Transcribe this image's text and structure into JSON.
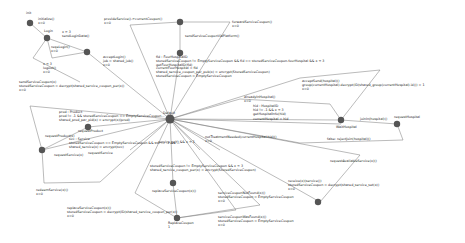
{
  "diagram": {
    "type": "state-machine",
    "nodes": [
      {
        "id": "init",
        "label": "init",
        "x": 30,
        "y": 23
      },
      {
        "id": "login",
        "label": "Login",
        "x": 47,
        "y": 38
      },
      {
        "id": "s2",
        "label": "",
        "x": 87,
        "y": 52
      },
      {
        "id": "s_top",
        "label": "",
        "x": 180,
        "y": 22
      },
      {
        "id": "s_topmid",
        "label": "",
        "x": 180,
        "y": 53
      },
      {
        "id": "central",
        "label": "Default",
        "x": 170,
        "y": 119
      },
      {
        "id": "reqProduct",
        "label": "requestProduct",
        "x": 88,
        "y": 127
      },
      {
        "id": "reqService",
        "label": "requestService",
        "x": 42,
        "y": 150
      },
      {
        "id": "waitHospital",
        "label": "WaitHospital",
        "x": 341,
        "y": 120
      },
      {
        "id": "reqHospital",
        "label": "requestHospital",
        "x": 397,
        "y": 124
      },
      {
        "id": "s_repl1",
        "label": "",
        "x": 173,
        "y": 183
      },
      {
        "id": "replaceCoupon",
        "label": "ReplaceCoupon",
        "x": 177,
        "y": 218
      },
      {
        "id": "s_right",
        "label": "",
        "x": 318,
        "y": 202
      }
    ],
    "labels": [
      {
        "id": "l_init",
        "text": "initialize()\nx=0",
        "x": 38,
        "y": 18
      },
      {
        "id": "l_login_s2",
        "text": "x > 3\nsendLoginData()",
        "x": 62,
        "y": 31
      },
      {
        "id": "l_reqlogin",
        "text": "reqeLogin()\nx=0",
        "x": 51,
        "y": 46
      },
      {
        "id": "l_x3",
        "text": "x < 3\nlogout()\nx=0",
        "x": 43,
        "y": 63
      },
      {
        "id": "l_accept",
        "text": "acceptLogin()\njob = shared_job()\nx=0",
        "x": 103,
        "y": 56
      },
      {
        "id": "l_provide",
        "text": "provideService()->currentCoupon()\nx=0",
        "x": 104,
        "y": 18
      },
      {
        "id": "l_forward",
        "text": "forwardServiceCoupon()\nx=0",
        "x": 232,
        "y": 21
      },
      {
        "id": "l_sendcoupon",
        "text": "sendServiceCouponViaPlatform()",
        "x": 185,
        "y": 35
      },
      {
        "id": "l_fid",
        "text": "fid : FourHospitalID\nstoredServiceCoupon != EmptyServiceCoupon && fid == storedServiceCoupon.fourHospital && x < 3\ngetFourHospitalID(fid)\ncurrentFourHospital = fid\nshared_service_coupon_per_pub(x) = encrypt(StoredServiceCoupon)\nstoredServiceCoupon = EmptyServiceCoupon",
        "x": 156,
        "y": 56
      },
      {
        "id": "l_sendsvc",
        "text": "sendServiceCoupon(x)\nstoredServiceCoupon = decrypt(shared_service_coupon_per(x))\nx=0",
        "x": 19,
        "y": 81
      },
      {
        "id": "l_prod",
        "text": "prod : Product\nprod != -1 && storedServiceCoupon == EmptyServiceCoupon...\nshared_prod_par_pid(x) = encrypt(x)(prod)",
        "x": 59,
        "y": 111
      },
      {
        "id": "l_reqprod",
        "text": "requestProduct(x)",
        "x": 45,
        "y": 135
      },
      {
        "id": "l_svc",
        "text": "svc : Service\nstoredServiceCoupon == EmptyServiceCoupon && svc != -1 && ...\nshared_service(x) = encrypt(svc)",
        "x": 69,
        "y": 138
      },
      {
        "id": "l_reqsvc",
        "text": "requestService(x)",
        "x": 54,
        "y": 154
      },
      {
        "id": "l_redeem",
        "text": "redeemService(x)()\nx=0",
        "x": 36,
        "y": 189
      },
      {
        "id": "l_already",
        "text": "alreadyInHospital()\nx=0",
        "x": 244,
        "y": 96
      },
      {
        "id": "l_hosp",
        "text": "hid : HospitalID\nhid != -1 && x < 3\ngetHospitalInfo(hid)",
        "x": 253,
        "y": 105
      },
      {
        "id": "l_curhosp",
        "text": "currentHospital = hid",
        "x": 253,
        "y": 118
      },
      {
        "id": "l_notin",
        "text": "notTreatmentNeeded(currentHospital.hid)()\nx=0",
        "x": 205,
        "y": 136
      },
      {
        "id": "l_service_ret",
        "text": "...service_self) && x < 1",
        "x": 155,
        "y": 141
      },
      {
        "id": "l_acceptB",
        "text": "acceptSend(hospital)()\ngroup(currentHospital).decrypt(ID(shared_group(currentHospital).id))) = 1\nx=0",
        "x": 302,
        "y": 80
      },
      {
        "id": "l_joinin",
        "text": "joinIn(hospital)()",
        "x": 360,
        "y": 118
      },
      {
        "id": "l_reqhosp",
        "text": "requestHospital",
        "x": 396,
        "y": 118
      },
      {
        "id": "l_false",
        "text": "false: rejectJoin(hospital)()",
        "x": 327,
        "y": 138
      },
      {
        "id": "l_avail",
        "text": "requestAvailableService(x)()",
        "x": 330,
        "y": 160
      },
      {
        "id": "l_stored2",
        "text": "storedServiceCoupon != EmptyServiceCoupon && x < 3\nshared_service_coupon_per(x) = encrypt(StoredServiceCoupon)",
        "x": 150,
        "y": 165
      },
      {
        "id": "l_replsvc",
        "text": "replaceServiceCoupon(x)()",
        "x": 152,
        "y": 190
      },
      {
        "id": "l_svcnotfound",
        "text": "serviceCouponNotFound(x)()\nstoredServiceCoupon = EmptyServiceCoupon\nx=0",
        "x": 218,
        "y": 192
      },
      {
        "id": "l_receive",
        "text": "receive(x)(service())\nstoredServiceCoupon = decrypt(shared_service_set(x))\nx=0",
        "x": 288,
        "y": 180
      },
      {
        "id": "l_replaceSvc2",
        "text": "replaceServiceCoupon(x)()\nstoredServiceCoupon = decrypt(ID(shared_service_coupon_per(x))\nx=0",
        "x": 67,
        "y": 207
      },
      {
        "id": "l_replcoupon",
        "text": "ReplaceCoupon\n1",
        "x": 168,
        "y": 222
      },
      {
        "id": "l_svcfound",
        "text": "serviceCouponWasFound(x)()\nstoredServiceCoupon = EmptyServiceCoupon\nx=0",
        "x": 218,
        "y": 216
      }
    ]
  },
  "colors": {
    "node": "#555555",
    "edge": "#777777",
    "text": "#222222",
    "background": "#ffffff"
  }
}
